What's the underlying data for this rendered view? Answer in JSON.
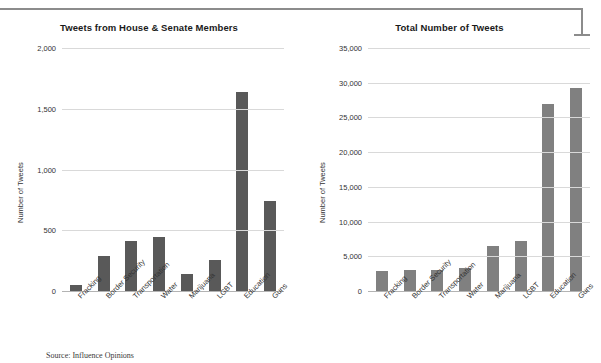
{
  "page": {
    "source_note": "Source: Influence Opinions"
  },
  "chart_data": [
    {
      "type": "bar",
      "id": "house-senate",
      "title": "Tweets from House & Senate Members",
      "xlabel": "",
      "ylabel": "Number of Tweets",
      "categories": [
        "Fracking",
        "Border Security",
        "Transportation",
        "Water",
        "Marijuana",
        "LGBT",
        "Education",
        "Guns"
      ],
      "values": [
        50,
        285,
        410,
        445,
        140,
        255,
        1640,
        740
      ],
      "ylim": [
        0,
        2000
      ],
      "yticks": [
        0,
        500,
        1000,
        1500,
        2000
      ],
      "ytick_labels": [
        "0",
        "500",
        "1,000",
        "1,500",
        "2,000"
      ],
      "grid": true,
      "legend": "none",
      "bar_color": "#595959"
    },
    {
      "type": "bar",
      "id": "total-tweets",
      "title": "Total Number of Tweets",
      "xlabel": "",
      "ylabel": "Number of Tweets",
      "categories": [
        "Fracking",
        "Border Security",
        "Transportation",
        "Water",
        "Marijuana",
        "LGBT",
        "Education",
        "Guns"
      ],
      "values": [
        2900,
        3000,
        3000,
        3300,
        6500,
        7200,
        27000,
        29300
      ],
      "ylim": [
        0,
        35000
      ],
      "yticks": [
        0,
        5000,
        10000,
        15000,
        20000,
        25000,
        30000,
        35000
      ],
      "ytick_labels": [
        "0",
        "5,000",
        "10,000",
        "15,000",
        "20,000",
        "25,000",
        "30,000",
        "35,000"
      ],
      "grid": true,
      "legend": "none",
      "bar_color": "#808080"
    }
  ]
}
